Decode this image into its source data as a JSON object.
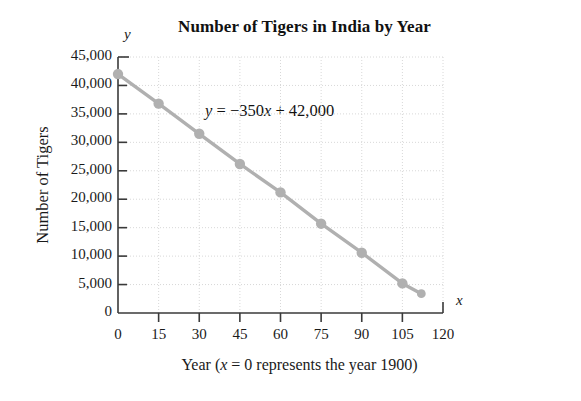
{
  "chart_data": {
    "type": "line",
    "title": "Number of Tigers in India by Year",
    "xlabel": "Year (x = 0 represents the year 1900)",
    "ylabel": "Number of Tigers",
    "x_axis_letter": "y",
    "y_axis_letter": "x",
    "annotation": "y = −350x + 42,000",
    "annotation_parts": {
      "var_y": "y",
      "equals": " = ",
      "slope_term": "−350",
      "var_x": "x",
      "plus_intercept": " + 42,000"
    },
    "xlim": [
      0,
      120
    ],
    "ylim": [
      0,
      45000
    ],
    "grid": true,
    "legend": "none",
    "x_tick_labels": [
      "0",
      "15",
      "30",
      "45",
      "60",
      "75",
      "90",
      "105",
      "120"
    ],
    "x_ticks": [
      0,
      15,
      30,
      45,
      60,
      75,
      90,
      105,
      120
    ],
    "y_tick_labels": [
      "0",
      "5,000",
      "10,000",
      "15,000",
      "20,000",
      "25,000",
      "30,000",
      "35,000",
      "40,000",
      "45,000"
    ],
    "y_ticks": [
      0,
      5000,
      10000,
      15000,
      20000,
      25000,
      30000,
      35000,
      40000,
      45000
    ],
    "x": [
      0,
      15,
      30,
      45,
      60,
      75,
      90,
      105,
      112
    ],
    "values": [
      42000,
      36800,
      31500,
      26200,
      21200,
      15700,
      10600,
      5200,
      3400
    ],
    "series": [
      {
        "name": "Number of Tigers",
        "x": [
          0,
          15,
          30,
          45,
          60,
          75,
          90,
          105,
          112
        ],
        "values": [
          42000,
          36800,
          31500,
          26200,
          21200,
          15700,
          10600,
          5200,
          3400
        ]
      }
    ],
    "colors": {
      "line": "#b0b0b0",
      "marker": "#b0b0b0",
      "axis": "#3a3a3a",
      "grid": "#d8d8d8",
      "text": "#1a1a1a"
    }
  }
}
